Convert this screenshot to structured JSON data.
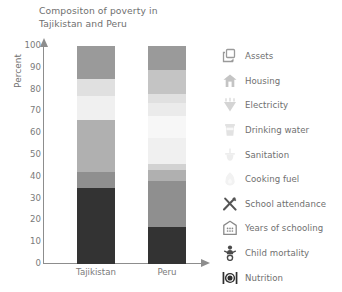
{
  "chart_data": {
    "type": "bar",
    "subtype": "stacked-bar-100",
    "title": "Compositon of poverty in Tajikistan and Peru",
    "title_line1": "Compositon of poverty in",
    "title_line2": "Tajikistan and Peru",
    "xlabel": "",
    "ylabel": "Percent",
    "ylim": [
      0,
      100
    ],
    "yticks": [
      100,
      90,
      80,
      70,
      60,
      50,
      40,
      30,
      20,
      10,
      0
    ],
    "grid": false,
    "legend_position": "right",
    "categories": [
      "Tajikistan",
      "Peru"
    ],
    "series": [
      {
        "name": "Nutrition",
        "color": "#333333",
        "values": [
          35,
          17
        ]
      },
      {
        "name": "Child mortality",
        "color": "#8f8f8f",
        "values": [
          7,
          21
        ]
      },
      {
        "name": "Years of schooling",
        "color": "#b0b0b0",
        "values": [
          24,
          5
        ]
      },
      {
        "name": "School attendance",
        "color": "#d2d2d2",
        "values": [
          0,
          3
        ]
      },
      {
        "name": "Cooking fuel",
        "color": "#f0f0f0",
        "values": [
          11,
          12
        ]
      },
      {
        "name": "Sanitation",
        "color": "#f7f7f7",
        "values": [
          0,
          10
        ]
      },
      {
        "name": "Drinking water",
        "color": "#ebebeb",
        "values": [
          0,
          6
        ]
      },
      {
        "name": "Electricity",
        "color": "#e0e0e0",
        "values": [
          8,
          4
        ]
      },
      {
        "name": "Housing",
        "color": "#c4c4c4",
        "values": [
          0,
          11
        ]
      },
      {
        "name": "Assets",
        "color": "#9a9a9a",
        "values": [
          15,
          11
        ]
      }
    ]
  },
  "title": {
    "line1": "Compositon of poverty in",
    "line2": "Tajikistan and Peru"
  },
  "axes": {
    "y_label": "Percent",
    "y_ticks": [
      "100",
      "90",
      "80",
      "70",
      "60",
      "50",
      "40",
      "30",
      "20",
      "10",
      "0"
    ],
    "x_labels": [
      "Tajikistan",
      "Peru"
    ]
  },
  "legend": {
    "items": [
      {
        "label": "Assets",
        "icon": "assets-icon",
        "color": "#9a9a9a"
      },
      {
        "label": "Housing",
        "icon": "housing-icon",
        "color": "#c4c4c4"
      },
      {
        "label": "Electricity",
        "icon": "electricity-icon",
        "color": "#d4d4d4"
      },
      {
        "label": "Drinking water",
        "icon": "drinking-water-icon",
        "color": "#e2e2e2"
      },
      {
        "label": "Sanitation",
        "icon": "sanitation-icon",
        "color": "#ededed"
      },
      {
        "label": "Cooking fuel",
        "icon": "cooking-fuel-icon",
        "color": "#f2f2f2"
      },
      {
        "label": "School attendance",
        "icon": "school-attendance-icon",
        "color": "#555555"
      },
      {
        "label": "Years of schooling",
        "icon": "years-of-schooling-icon",
        "color": "#8a8a8a"
      },
      {
        "label": "Child mortality",
        "icon": "child-mortality-icon",
        "color": "#4a4a4a"
      },
      {
        "label": "Nutrition",
        "icon": "nutrition-icon",
        "color": "#2e2e2e"
      }
    ]
  }
}
